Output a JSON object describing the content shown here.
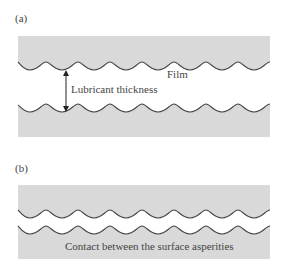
{
  "colors": {
    "background": "#ffffff",
    "surface_fill": "#d9d9d9",
    "line": "#444444",
    "text": "#444444"
  },
  "panel_a": {
    "label": "(a)",
    "film_label": "Film",
    "thickness_label": "Lubricant thickness",
    "arrow": "double-headed-vertical-arrow"
  },
  "panel_b": {
    "label": "(b)",
    "contact_label": "Contact between the surface asperities"
  }
}
